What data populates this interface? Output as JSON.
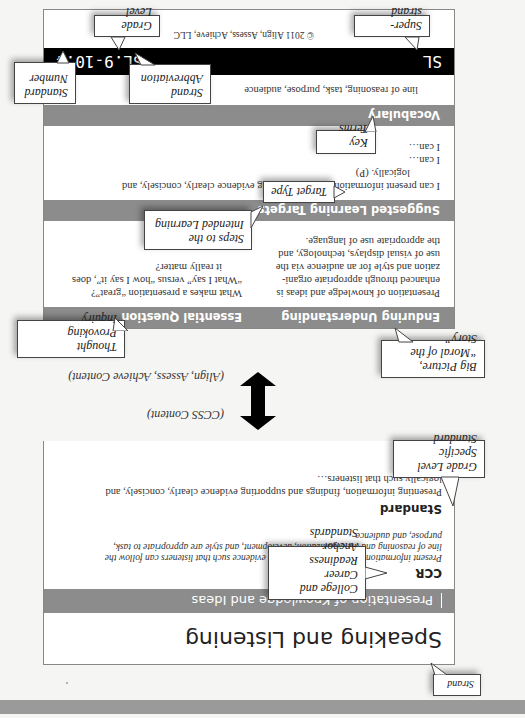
{
  "page": {
    "orientation": "rotated-180",
    "colors": {
      "band_gray": "#8c8c8c",
      "footer_black": "#000000",
      "page_bar": "#9a9a9a"
    }
  },
  "standard_card": {
    "strand_title": "Speaking and Listening",
    "sub_strand": "Presentation of Knowledge and Ideas",
    "ccr_label": "CCR",
    "ccr_text_line1": "Present information, findings, and supporting evidence such that listeners can follow the",
    "ccr_text_line2": "line of reasoning and the organization, development, and style are appropriate to task,",
    "ccr_text_line3": "purpose, and audience.",
    "standard_label": "Standard",
    "standard_text_line1": "Presenting information, findings and supporting evidence clearly, concisely, and",
    "standard_text_line2": "logically such that listeners…"
  },
  "connector": {
    "top_label": "(CCSS Content)",
    "bottom_label": "(Align, Assess, Achieve Content)"
  },
  "aaa_card": {
    "enduring_understanding_header": "Enduring Understanding",
    "essential_question_header": "Essential Question",
    "enduring_understanding_text": [
      "Presentation of knowledge and ideas is",
      "enhanced through appropriate organi-",
      "zation and style for an audience via the",
      "use of visual displays, technology, and",
      "the appropriate use of language."
    ],
    "essential_question_text": [
      "What makes a presentation “great”?",
      "“What I say” versus “how I say it”, does",
      "it really matter?"
    ],
    "learning_targets_header": "Suggested Learning Targets",
    "learning_targets": [
      "I can present information and/or supporting evidence clearly, concisely, and",
      "logically. (P)",
      "I can…",
      "I can…"
    ],
    "vocabulary_header": "Vocabulary",
    "vocabulary_text": "line of reasoning, task, purpose, audience",
    "footer_super_strand": "SL",
    "footer_standard_code": "SL.9-10.4",
    "copyright": "© 2011 Align, Assess, Achieve, LLC"
  },
  "callouts": {
    "strand": "Strand",
    "ccr": [
      "College and",
      "Career Readiness",
      "Anchor Standards"
    ],
    "grade_specific": [
      "Grade Level",
      "Specific Standard"
    ],
    "big_picture": [
      "Big Picture,",
      "“Moral of the Story”"
    ],
    "thought_provoking": [
      "Thought Provoking",
      "Inquiry"
    ],
    "steps": [
      "Steps to the",
      "Intended Learning"
    ],
    "target_type": "Target Type",
    "key_terms": "Key Terms",
    "strand_abbreviation": [
      "Strand",
      "Abbreviation"
    ],
    "standard_number": [
      "Standard",
      "Number"
    ],
    "super_strand": "Super-strand",
    "grade_level": "Grade Level"
  }
}
